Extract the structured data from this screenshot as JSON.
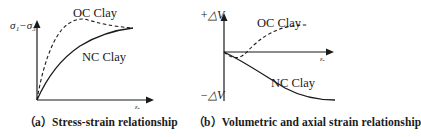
{
  "figure": {
    "panels": [
      {
        "id": "a",
        "caption": "（a）Stress-strain relationship",
        "y_axis_label": "σ₁−σ₃",
        "x_axis_label": "εₐ",
        "curves": [
          {
            "name": "OC Clay",
            "style": "dashed",
            "shape": "rises steeply to peak then softens to meet NC curve"
          },
          {
            "name": "NC Clay",
            "style": "solid",
            "shape": "monotonic hardening curve"
          }
        ]
      },
      {
        "id": "b",
        "caption": "（b）Volumetric and axial strain relationship",
        "y_axis_top_label": "+△V",
        "y_axis_bottom_label": "−△V",
        "x_axis_label": "εₐ",
        "curves": [
          {
            "name": "OC Clay",
            "style": "dashed",
            "shape": "slight contraction then dilation (positive volume change)"
          },
          {
            "name": "NC Clay",
            "style": "solid",
            "shape": "continuous contraction (negative volume change)"
          }
        ]
      }
    ]
  },
  "colors": {
    "line": "#1a1a1a",
    "background": "#ffffff"
  }
}
